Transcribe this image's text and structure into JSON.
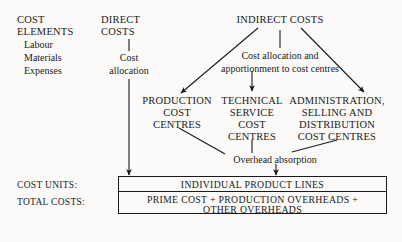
{
  "diagram": {
    "colors": {
      "ink": "#1a1a1a",
      "background": "#fbfaf8"
    },
    "columns": {
      "cost_elements": {
        "heading_line1": "COST",
        "heading_line2": "ELEMENTS",
        "items": [
          "Labour",
          "Materials",
          "Expenses"
        ]
      },
      "direct_costs": {
        "heading_line1": "DIRECT",
        "heading_line2": "COSTS",
        "process_line1": "Cost",
        "process_line2": "allocation"
      },
      "indirect_costs": {
        "heading": "INDIRECT COSTS",
        "process_line1": "Cost allocation and",
        "process_line2": "apportionment to cost centres"
      }
    },
    "cost_centres": {
      "production": {
        "line1": "PRODUCTION",
        "line2": "COST",
        "line3": "CENTRES"
      },
      "technical_service": {
        "line1": "TECHNICAL",
        "line2": "SERVICE",
        "line3": "COST",
        "line4": "CENTRES"
      },
      "administration": {
        "line1": "ADMINISTRATION,",
        "line2": "SELLING AND",
        "line3": "DISTRIBUTION",
        "line4": "COST CENTRES"
      }
    },
    "overhead_absorption_label": "Overhead absorption",
    "outcome": {
      "cost_units_label": "COST UNITS:",
      "total_costs_label": "TOTAL COSTS:",
      "cost_units_value": "INDIVIDUAL PRODUCT LINES",
      "total_costs_line1": "PRIME COST + PRODUCTION OVERHEADS +",
      "total_costs_line2": "OTHER OVERHEADS"
    }
  }
}
